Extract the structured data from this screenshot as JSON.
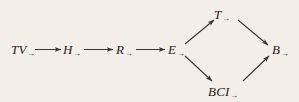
{
  "figure": {
    "type": "implication-diagram",
    "background_color": "#f2efe9",
    "ink_color": "#26221e"
  },
  "nodes": [
    {
      "id": "tv",
      "base": "TV",
      "subscript": "→",
      "full_label": "TV→",
      "x": 20,
      "y": 50
    },
    {
      "id": "h",
      "base": "H",
      "subscript": "→",
      "full_label": "H→",
      "x": 68,
      "y": 50
    },
    {
      "id": "r",
      "base": "R",
      "subscript": "→",
      "full_label": "R→",
      "x": 121,
      "y": 50
    },
    {
      "id": "e",
      "base": "E",
      "subscript": "→",
      "full_label": "E→",
      "x": 173,
      "y": 50
    },
    {
      "id": "t",
      "base": "T",
      "subscript": "→",
      "full_label": "T→",
      "x": 220,
      "y": 15
    },
    {
      "id": "bci",
      "base": "BCI",
      "subscript": "→",
      "full_label": "BCI→",
      "x": 220,
      "y": 92
    },
    {
      "id": "b",
      "base": "B",
      "subscript": "→",
      "full_label": "B→",
      "x": 278,
      "y": 50
    }
  ],
  "edges": [
    {
      "from": "tv",
      "to": "h",
      "style": "arrow"
    },
    {
      "from": "h",
      "to": "r",
      "style": "arrow"
    },
    {
      "from": "r",
      "to": "e",
      "style": "arrow"
    },
    {
      "from": "e",
      "to": "t",
      "style": "arrow"
    },
    {
      "from": "e",
      "to": "bci",
      "style": "arrow"
    },
    {
      "from": "t",
      "to": "b",
      "style": "arrow"
    },
    {
      "from": "bci",
      "to": "b",
      "style": "arrow"
    }
  ]
}
